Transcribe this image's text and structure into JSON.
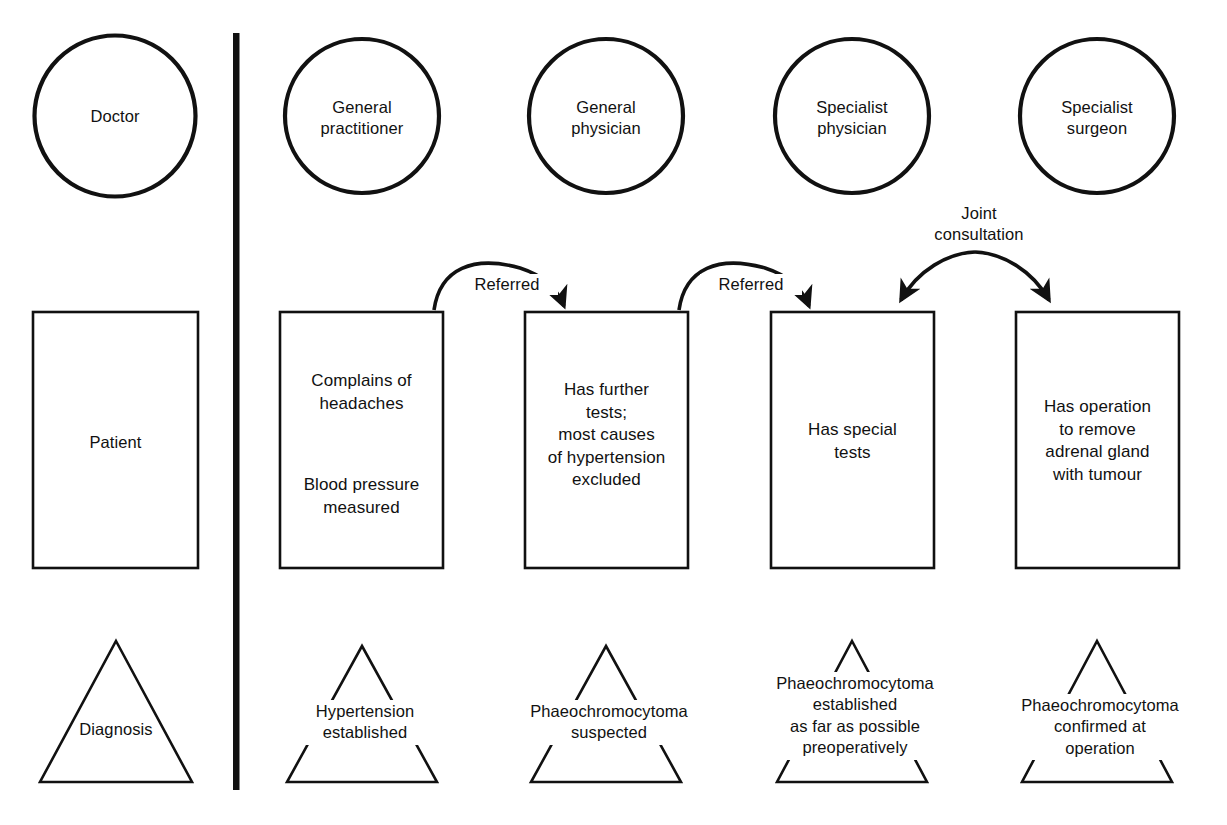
{
  "diagram": {
    "type": "flow-diagram",
    "stroke_color": "#111111",
    "background_color": "#ffffff",
    "row_labels": {
      "doctor": "Doctor",
      "patient": "Patient",
      "diagnosis": "Diagnosis"
    },
    "divider": {
      "name": "vertical-divider",
      "orientation": "vertical"
    },
    "columns": [
      {
        "id": "gp",
        "role": "General\npractitioner",
        "box": "Complains of\nheadaches",
        "box_second": "Blood pressure\nmeasured",
        "triangle": "Hypertension\nestablished"
      },
      {
        "id": "general-physician",
        "role": "General\nphysician",
        "box": "Has further\ntests;\nmost causes\nof hypertension\nexcluded",
        "box_second": "",
        "triangle": "Phaeochromocytoma\nsuspected"
      },
      {
        "id": "specialist-physician",
        "role": "Specialist\nphysician",
        "box": "Has special\ntests",
        "box_second": "",
        "triangle": "Phaeochromocytoma\nestablished\nas far as possible\npreoperatively"
      },
      {
        "id": "specialist-surgeon",
        "role": "Specialist\nsurgeon",
        "box": "Has operation\nto remove\nadrenal gland\nwith tumour",
        "box_second": "",
        "triangle": "Phaeochromocytoma\nconfirmed at\noperation"
      }
    ],
    "arrows": [
      {
        "id": "referred-1",
        "label": "Referred",
        "from": "gp",
        "to": "general-physician"
      },
      {
        "id": "referred-2",
        "label": "Referred",
        "from": "general-physician",
        "to": "specialist-physician"
      },
      {
        "id": "joint-consultation",
        "label": "Joint\nconsultation",
        "from": "specialist-physician",
        "to": "specialist-surgeon"
      }
    ]
  }
}
